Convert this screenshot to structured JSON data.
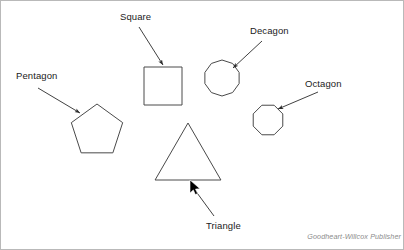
{
  "figure": {
    "kind": "polygon-identification-diagram",
    "background_color": "#ffffff",
    "border_color": "#b9b9b9",
    "shape_stroke_color": "#4a4a4a",
    "leader_stroke_color": "#2b2b2b",
    "label_text_color": "#1b1b1b",
    "credit_text_color": "#8c8c8c"
  },
  "labels": {
    "pentagon": "Pentagon",
    "square": "Square",
    "decagon": "Decagon",
    "octagon": "Octagon",
    "triangle": "Triangle"
  },
  "shapes": [
    {
      "name": "pentagon",
      "sides": 5,
      "label": "Pentagon",
      "center_x": 97,
      "center_y": 131,
      "radius": 27
    },
    {
      "name": "square",
      "sides": 4,
      "label": "Square",
      "center_x": 163,
      "center_y": 86,
      "radius": 19
    },
    {
      "name": "decagon",
      "sides": 10,
      "label": "Decagon",
      "center_x": 222,
      "center_y": 78,
      "radius": 18
    },
    {
      "name": "octagon",
      "sides": 8,
      "label": "Octagon",
      "center_x": 268,
      "center_y": 120,
      "radius": 16
    },
    {
      "name": "triangle",
      "sides": 3,
      "label": "Triangle",
      "center_x": 188,
      "center_y": 161,
      "radius": 38
    }
  ],
  "leaders": [
    {
      "name": "pentagon-leader",
      "from_x": 38,
      "from_y": 88,
      "to_x": 80,
      "to_y": 113
    },
    {
      "name": "square-leader",
      "from_x": 139,
      "from_y": 27,
      "to_x": 163,
      "to_y": 65
    },
    {
      "name": "decagon-leader",
      "from_x": 262,
      "from_y": 41,
      "to_x": 233,
      "to_y": 68
    },
    {
      "name": "octagon-leader",
      "from_x": 318,
      "from_y": 92,
      "to_x": 278,
      "to_y": 109
    },
    {
      "name": "triangle-leader",
      "from_x": 214,
      "from_y": 216,
      "to_x": 192,
      "to_y": 186
    }
  ],
  "cursor": {
    "name": "mouse-pointer",
    "x": 190,
    "y": 180
  },
  "credit": {
    "text": "Goodheart-Willcox Publisher"
  }
}
